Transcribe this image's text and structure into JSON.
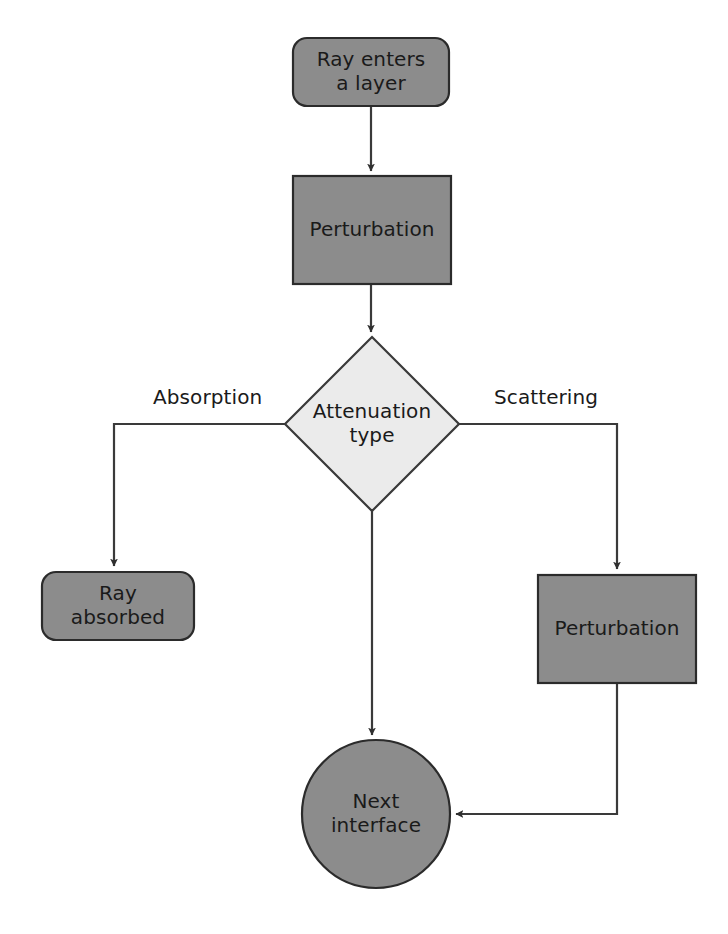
{
  "diagram": {
    "colors": {
      "node_fill_dark": "#8c8c8c",
      "node_fill_decision": "#ebebeb",
      "node_stroke": "#333333",
      "edge_stroke": "#3a3a3a",
      "background": "#ffffff",
      "text": "#1a1a1a"
    },
    "nodes": [
      {
        "id": "ray-enters",
        "shape": "rounded-rectangle",
        "label": "Ray enters\na layer",
        "x": 293,
        "y": 38,
        "width": 156,
        "height": 68
      },
      {
        "id": "perturbation-top",
        "shape": "rectangle",
        "label": "Perturbation",
        "x": 293,
        "y": 176,
        "width": 158,
        "height": 108
      },
      {
        "id": "attenuation-type",
        "shape": "diamond",
        "label": "Attenuation\ntype",
        "cx": 372,
        "cy": 424,
        "rx": 87,
        "ry": 87
      },
      {
        "id": "ray-absorbed",
        "shape": "rounded-rectangle",
        "label": "Ray\nabsorbed",
        "x": 42,
        "y": 572,
        "width": 152,
        "height": 68
      },
      {
        "id": "perturbation-bottom",
        "shape": "rectangle",
        "label": "Perturbation",
        "x": 538,
        "y": 575,
        "width": 158,
        "height": 108
      },
      {
        "id": "next-interface",
        "shape": "circle",
        "label": "Next\ninterface",
        "cx": 376,
        "cy": 814,
        "r": 74
      }
    ],
    "edge_labels": [
      {
        "id": "absorption-label",
        "text": "Absorption",
        "x": 153,
        "y": 385
      },
      {
        "id": "scattering-label",
        "text": "Scattering",
        "x": 494,
        "y": 385
      }
    ],
    "edges": [
      {
        "id": "edge-enters-to-perturbation",
        "from": "ray-enters",
        "to": "perturbation-top",
        "arrow": true
      },
      {
        "id": "edge-perturbation-to-decision",
        "from": "perturbation-top",
        "to": "attenuation-type",
        "arrow": true
      },
      {
        "id": "edge-decision-absorption",
        "from": "attenuation-type",
        "to": "ray-absorbed",
        "arrow": true,
        "label": "Absorption"
      },
      {
        "id": "edge-decision-scattering",
        "from": "attenuation-type",
        "to": "perturbation-bottom",
        "arrow": true,
        "label": "Scattering"
      },
      {
        "id": "edge-decision-to-next-interface",
        "from": "attenuation-type",
        "to": "next-interface",
        "arrow": true
      },
      {
        "id": "edge-perturbation-bottom-to-next-interface",
        "from": "perturbation-bottom",
        "to": "next-interface",
        "arrow": true
      }
    ]
  }
}
